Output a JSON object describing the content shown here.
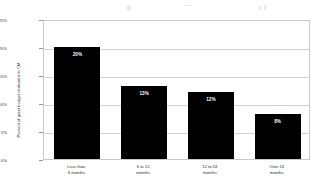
{
  "chart_data": {
    "type": "bar",
    "title": "",
    "xlabel": "",
    "ylabel": "Percent of grant budget dedicated to CM",
    "categories": [
      "Less than 6 months",
      "6 to 12 months",
      "12 to 24 months",
      "Over 24 months"
    ],
    "category_lines": [
      [
        "Less than",
        "6 months"
      ],
      [
        "6 to 12",
        "months"
      ],
      [
        "12 to 24",
        "months"
      ],
      [
        "Over 24",
        "months"
      ]
    ],
    "values": [
      20,
      13,
      12,
      8
    ],
    "value_labels": [
      "20%",
      "13%",
      "12%",
      "8%"
    ],
    "ylim": [
      0,
      25
    ],
    "yticks": [
      0,
      5,
      10,
      15,
      20,
      25
    ],
    "ytick_labels": [
      "0%",
      "5%",
      "10%",
      "15%",
      "20%",
      "25%"
    ],
    "grid": true,
    "legend": false,
    "bar_color": "#000000",
    "value_label_color": "#ffffff",
    "gridline_color": "#d2d2d2",
    "plot_border_color": "#c8c8c8",
    "background_color": "#ffffff"
  }
}
